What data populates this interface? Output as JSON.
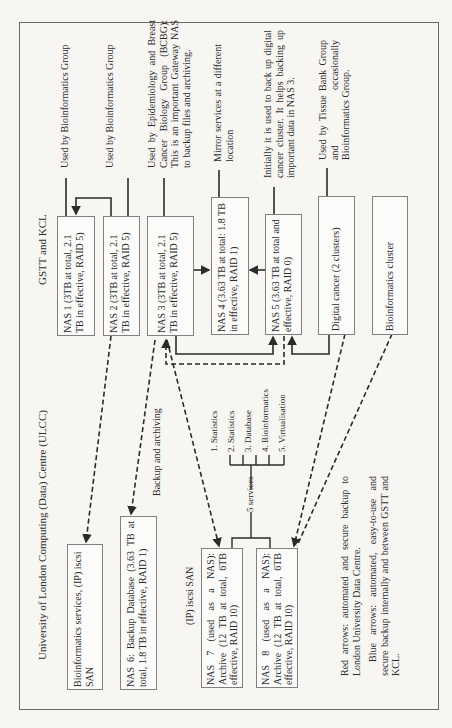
{
  "regions": {
    "gstt_kcl": "GSTT and KCL",
    "ulcc": "University of London Computing (Data) Centre (ULCC)"
  },
  "gstt_boxes": [
    {
      "id": "nas1",
      "label": "NAS 1 (3TB at total, 2.1 TB in effective, RAID 5)"
    },
    {
      "id": "nas2",
      "label": "NAS 2 (3TB at total, 2.1 TB in effective, RAID 5)"
    },
    {
      "id": "nas3",
      "label": "NAS 3 (3TB at total, 2.1 TB in effective, RAID 5)"
    },
    {
      "id": "nas4",
      "label": "NAS 4 (3.63 TB at total: 1.8 TB in effective, RAID 1)"
    },
    {
      "id": "nas5",
      "label": "NAS 5 (3.63 TB at total and effective, RAID 0)"
    },
    {
      "id": "digital",
      "label": "Digital cancer (2 clusters)"
    },
    {
      "id": "bioclust",
      "label": "Bioinformatics cluster"
    }
  ],
  "annotations": [
    {
      "for": "nas1",
      "text": "Used by Bioinformatics Group"
    },
    {
      "for": "nas2",
      "text": "Used by Bioinformatics Group"
    },
    {
      "for": "nas3",
      "text": "Used by Epidemiology and Breast Cancer Biology Group (BCBG): This is an important Gateway NAS to backup files and archiving."
    },
    {
      "for": "nas4",
      "text": "Mirror services at a different location"
    },
    {
      "for": "nas5",
      "text": "Initially it is used to back up digital cancer cluster. It helps backing up important data in NAS 3."
    },
    {
      "for": "digital",
      "text": "Used by Tissue Bank Group and occasionally Bioinformatics Group."
    }
  ],
  "ulcc_boxes": [
    {
      "id": "bioserv",
      "label": "Bioinformatics services, (IP) iscsi SAN"
    },
    {
      "id": "nas6",
      "label": "NAS 6: Backup Database (3.63 TB at total, 1.8 TB in effective, RAID 1)"
    },
    {
      "id": "nas7",
      "label": "NAS 7 (used as a NAS): Archive (12 TB at total, 6TB effective, RAID 10)"
    },
    {
      "id": "nas8",
      "label": "NAS 8 (used as a NAS): Archive (12 TB at total, 6TB effective, RAID 10)"
    }
  ],
  "ulcc_labels": {
    "backup_archiving": "Backup and archiving",
    "ip_iscsi_san": "(IP) iscsi SAN",
    "services_count": "5 services"
  },
  "services": [
    "1. Statistics",
    "2. Statistics",
    "3. Database",
    "4. Bioinformatics",
    "5. Virtualisation"
  ],
  "legend": {
    "red": "Red arrows: automated and secure backup to London University Data Centre.",
    "blue": "Blue arrows: automated, easy-to-use and secure backup internally and between GSTT and KCL."
  },
  "colors": {
    "line": "#2b2b2b",
    "box_border": "#808080",
    "background": "#f7f6f3"
  }
}
